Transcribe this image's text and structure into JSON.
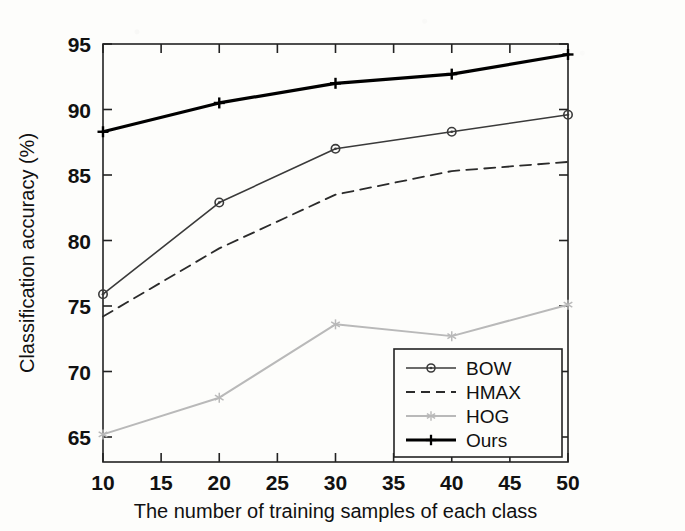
{
  "chart_data": {
    "type": "line",
    "title": "",
    "xlabel": "The number of training samples of each class",
    "ylabel": "Classification accuracy (%)",
    "x": [
      10,
      20,
      30,
      40,
      50
    ],
    "xticks": [
      10,
      15,
      20,
      25,
      30,
      35,
      40,
      45,
      50
    ],
    "yticks": [
      65,
      70,
      75,
      80,
      85,
      90,
      95
    ],
    "xlim": [
      10,
      50
    ],
    "ylim": [
      63.5,
      95
    ],
    "grid": false,
    "legend_position": "lower right",
    "series": [
      {
        "name": "BOW",
        "values": [
          75.9,
          82.9,
          87.0,
          88.3,
          89.6
        ],
        "color": "#3a3a3a",
        "marker": "circle",
        "dash": "none",
        "width": 1.6
      },
      {
        "name": "HMAX",
        "values": [
          74.2,
          79.4,
          83.5,
          85.3,
          86.0
        ],
        "color": "#2b2b2b",
        "marker": "none",
        "dash": "dashed",
        "width": 1.8
      },
      {
        "name": "HOG",
        "values": [
          65.2,
          68.0,
          73.6,
          72.7,
          75.1
        ],
        "color": "#b9b9b9",
        "marker": "star",
        "dash": "none",
        "width": 2.0
      },
      {
        "name": "Ours",
        "values": [
          88.3,
          90.5,
          92.0,
          92.7,
          94.2
        ],
        "color": "#000000",
        "marker": "plus",
        "dash": "none",
        "width": 3.2
      }
    ]
  },
  "axes": {
    "ytick_labels": [
      "95",
      "90",
      "85",
      "80",
      "75",
      "70",
      "65"
    ],
    "xtick_labels": [
      "10",
      "15",
      "20",
      "25",
      "30",
      "35",
      "40",
      "45",
      "50"
    ],
    "x_axis_title": "The number of training samples of each class",
    "y_axis_title": "Classification accuracy (%)"
  },
  "legend": {
    "entries": [
      {
        "label": "BOW",
        "marker": "circle-marker",
        "style": "solid"
      },
      {
        "label": "HMAX",
        "marker": "no-marker",
        "style": "dashed"
      },
      {
        "label": "HOG",
        "marker": "star-marker",
        "style": "solid-light"
      },
      {
        "label": "Ours",
        "marker": "plus-marker",
        "style": "solid-bold"
      }
    ]
  }
}
